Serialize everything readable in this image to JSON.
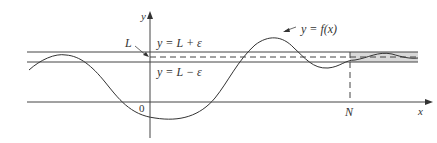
{
  "diagram": {
    "colors": {
      "line": "#444444",
      "band_fill": "#d9d9d9",
      "background": "#ffffff"
    },
    "axes": {
      "x_label": "x",
      "y_label": "y",
      "origin_label": "0"
    },
    "labels": {
      "L": "L",
      "upper_bound": "y = L + ε",
      "lower_bound": "y = L − ε",
      "curve": "y = f(x)",
      "N": "N"
    }
  }
}
